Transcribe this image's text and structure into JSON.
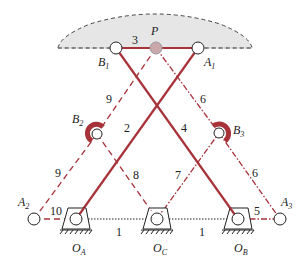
{
  "colors": {
    "link": "#a8323a",
    "ground_link": "#222222",
    "region_fill": "#e4e4e4",
    "pin_fill": "#ffffff",
    "pin_P_fill": "#c9a7aa"
  },
  "points": {
    "B1": {
      "label": "B",
      "sub": "1",
      "x": 116,
      "y": 48
    },
    "P": {
      "label": "P",
      "x": 156,
      "y": 48
    },
    "A1": {
      "label": "A",
      "sub": "1",
      "x": 198,
      "y": 48
    },
    "B2": {
      "label": "B",
      "sub": "2",
      "x": 97,
      "y": 134
    },
    "B3": {
      "label": "B",
      "sub": "3",
      "x": 219,
      "y": 133
    },
    "A2": {
      "label": "A",
      "sub": "2",
      "x": 34,
      "y": 219
    },
    "A3": {
      "label": "A",
      "sub": "3",
      "x": 280,
      "y": 219
    },
    "OA": {
      "label": "O",
      "sub": "A",
      "x": 76,
      "y": 219
    },
    "OC": {
      "label": "O",
      "sub": "C",
      "x": 157,
      "y": 219
    },
    "OB": {
      "label": "O",
      "sub": "B",
      "x": 238,
      "y": 219
    }
  },
  "link_labels": {
    "l1a": "1",
    "l1b": "1",
    "l2": "2",
    "l3": "3",
    "l4": "4",
    "l5": "5",
    "l6a": "6",
    "l6b": "6",
    "l7": "7",
    "l8": "8",
    "l9a": "9",
    "l9b": "9",
    "l10": "10"
  },
  "point_labels": {
    "P": "P",
    "B1": "B",
    "B1_sub": "1",
    "A1": "A",
    "A1_sub": "1",
    "B2": "B",
    "B2_sub": "2",
    "B3": "B",
    "B3_sub": "3",
    "A2": "A",
    "A2_sub": "2",
    "A3": "A",
    "A3_sub": "3",
    "OA": "O",
    "OA_sub": "A",
    "OC": "O",
    "OC_sub": "C",
    "OB": "O",
    "OB_sub": "B"
  }
}
